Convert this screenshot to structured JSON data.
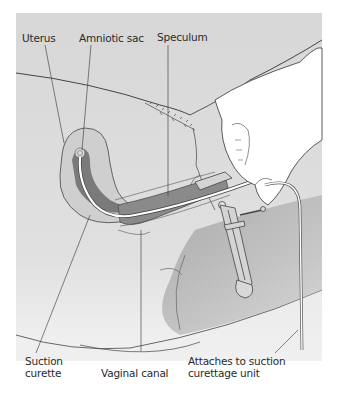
{
  "figure": {
    "type": "medical-illustration",
    "colors": {
      "panel_top": "#d6d6d6",
      "panel_bottom": "#f2f2f2",
      "body_fill": "#d9d9d9",
      "hand_fill": "#ffffff",
      "dark_tissue": "#7d7d7d",
      "uterus_fill": "#c9c9c9",
      "line": "#3a3a3a"
    }
  },
  "labels": {
    "uterus": "Uterus",
    "amniotic_sac": "Amniotic sac",
    "speculum": "Speculum",
    "suction_curette_line1": "Suction",
    "suction_curette_line2": "curette",
    "vaginal_canal": "Vaginal canal",
    "attaches_line1": "Attaches to suction",
    "attaches_line2": "curettage unit"
  }
}
